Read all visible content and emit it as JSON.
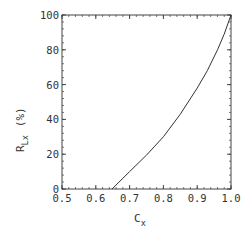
{
  "chart_data": {
    "type": "line",
    "title": "",
    "xlabel": "C_x",
    "ylabel": "R_Lx (%)",
    "xlabel_parts": {
      "main": "C",
      "sub": "x"
    },
    "ylabel_parts": {
      "main": "R",
      "sub": "Lx",
      "unit": "(%)"
    },
    "xlim": [
      0.5,
      1.0
    ],
    "ylim": [
      0,
      100
    ],
    "xticks": [
      0.5,
      0.6,
      0.7,
      0.8,
      0.9,
      1.0
    ],
    "xtick_labels": [
      "0.5",
      "0.6",
      "0.7",
      "0.8",
      "0.9",
      "1.0"
    ],
    "yticks": [
      0,
      20,
      40,
      60,
      80,
      100
    ],
    "ytick_labels": [
      "0",
      "20",
      "40",
      "60",
      "80",
      "100"
    ],
    "x_minor_step": 0.02,
    "y_minor_step": 4,
    "grid": false,
    "legend": null,
    "series": [
      {
        "name": "R_Lx",
        "color": "#333333",
        "x": [
          0.648,
          0.7,
          0.75,
          0.8,
          0.85,
          0.9,
          0.93,
          0.96,
          0.98,
          1.0
        ],
        "y": [
          0,
          10,
          19.5,
          30,
          43,
          58,
          68,
          80,
          89,
          100
        ]
      }
    ]
  }
}
